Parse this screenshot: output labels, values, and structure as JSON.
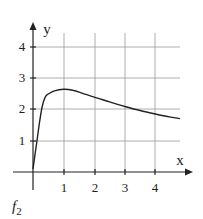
{
  "chart_data": {
    "type": "line",
    "title": "",
    "caption": "f",
    "caption_subscript": "2",
    "xlabel": "x",
    "ylabel": "y",
    "xlim": [
      0,
      4.9
    ],
    "ylim": [
      0,
      4.6
    ],
    "x_ticks": [
      "1",
      "2",
      "3",
      "4"
    ],
    "y_ticks": [
      "1",
      "2",
      "3",
      "4"
    ],
    "grid": true,
    "legend": null,
    "series": [
      {
        "name": "f2",
        "x": [
          0,
          0.1,
          0.2,
          0.3,
          0.4,
          0.5,
          0.7,
          1.0,
          1.3,
          1.6,
          2.0,
          2.5,
          3.0,
          3.5,
          4.0,
          4.5,
          4.8
        ],
        "y": [
          0.1,
          0.8,
          1.5,
          2.1,
          2.4,
          2.5,
          2.6,
          2.65,
          2.62,
          2.53,
          2.4,
          2.25,
          2.1,
          1.97,
          1.86,
          1.76,
          1.71
        ]
      }
    ]
  },
  "labels": {
    "x_axis": "x",
    "y_axis": "y",
    "x_tick_1": "1",
    "x_tick_2": "2",
    "x_tick_3": "3",
    "x_tick_4": "4",
    "y_tick_1": "1",
    "y_tick_2": "2",
    "y_tick_3": "3",
    "y_tick_4": "4",
    "caption_main": "f",
    "caption_sub": "2"
  }
}
